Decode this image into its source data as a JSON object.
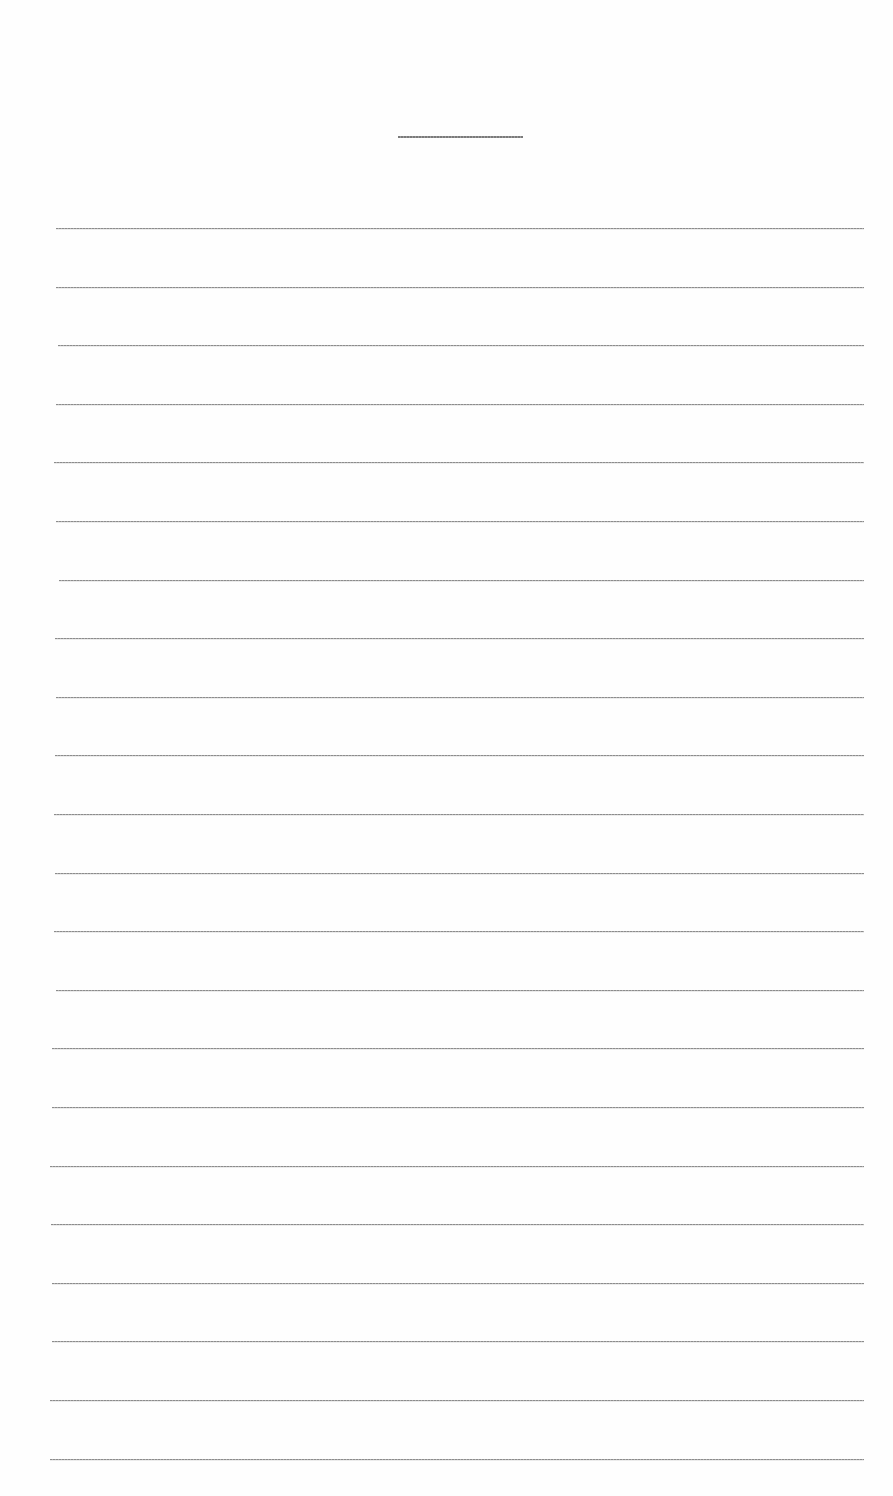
{
  "document": {
    "type": "lined-paper",
    "background_color": "#fefefe",
    "line_color": "#8c8c8c",
    "title_line": {
      "x": 398,
      "y": 136,
      "width": 125
    },
    "ruled_lines": {
      "count": 22,
      "first_y": 228,
      "spacing": 58.6,
      "left": 56,
      "right": 864
    }
  }
}
